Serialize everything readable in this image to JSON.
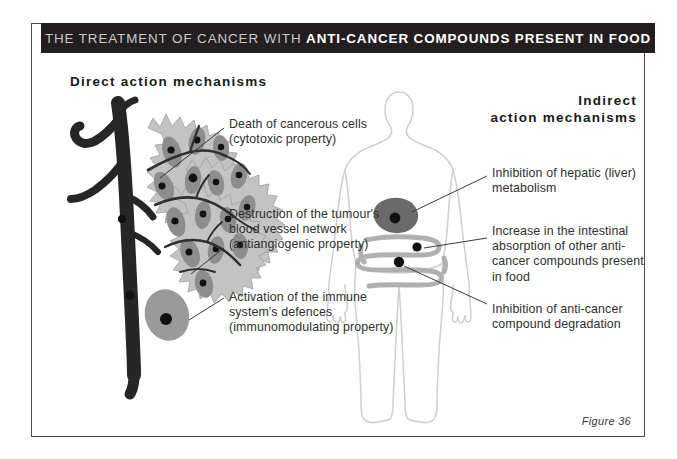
{
  "title": {
    "lead": "THE TREATMENT OF CANCER WITH ",
    "emphasis": "ANTI-CANCER COMPOUNDS PRESENT IN FOOD"
  },
  "headings": {
    "direct": "Direct action mechanisms",
    "indirect_line1": "Indirect",
    "indirect_line2": "action mechanisms"
  },
  "labels": {
    "cytotoxic": "Death of cancerous cells (cytotoxic property)",
    "antiangiogenic": "Destruction of the tumour's blood vessel network (antiangiogenic property)",
    "immunomodulating": "Activation of the immune system's defences (immunomodulating property)",
    "hepatic": "Inhibition of hepatic (liver) metabolism",
    "intestinal": "Increase in the intestinal absorption of other anti-cancer compounds present in food",
    "degradation": "Inhibition of anti-cancer compound degradation"
  },
  "caption": "Figure 36",
  "colors": {
    "title_bar_background": "#231f20",
    "title_lead_text": "#c9c9c9",
    "title_emphasis_text": "#ffffff",
    "frame_border": "#4a4a4a",
    "page_background": "#ffffff",
    "blood_vessel": "#262626",
    "tumour_mass": "#c3c3c3",
    "tumour_cell": "#8d8d8d",
    "cell_nucleus": "#111111",
    "immune_cell": "#9a9a9a",
    "body_outline": "#cfcfcf",
    "liver": "#6a6a6a",
    "intestine": "#b0b0b0",
    "leader_line": "#3a3a3a",
    "text": "#2f2f2f"
  },
  "icons": {
    "blood_vessel": "blood-vessel-icon",
    "tumour": "tumour-mass-icon",
    "immune_cell": "immune-cell-icon",
    "body": "human-body-silhouette-icon",
    "liver": "liver-organ-icon",
    "intestine": "intestine-organ-icon"
  }
}
